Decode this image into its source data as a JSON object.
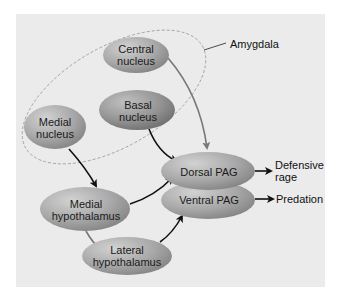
{
  "diagram": {
    "group_label": "Amygdala",
    "nodes": {
      "central_nucleus": {
        "line1": "Central",
        "line2": "nucleus"
      },
      "basal_nucleus": {
        "line1": "Basal",
        "line2": "nucleus"
      },
      "medial_nucleus": {
        "line1": "Medial",
        "line2": "nucleus"
      },
      "medial_hypothalamus": {
        "line1": "Medial",
        "line2": "hypothalamus"
      },
      "lateral_hypothalamus": {
        "line1": "Lateral",
        "line2": "hypothalamus"
      },
      "dorsal_pag": {
        "label": "Dorsal PAG"
      },
      "ventral_pag": {
        "label": "Ventral PAG"
      }
    },
    "outputs": {
      "defensive_rage": {
        "line1": "Defensive",
        "line2": "rage"
      },
      "predation": {
        "label": "Predation"
      }
    },
    "edges": [
      {
        "from": "Central nucleus",
        "to": "Dorsal PAG",
        "color": "#777777"
      },
      {
        "from": "Basal nucleus",
        "to": "Dorsal PAG",
        "color": "#111111"
      },
      {
        "from": "Medial nucleus",
        "to": "Medial hypothalamus",
        "color": "#111111"
      },
      {
        "from": "Medial hypothalamus",
        "to": "Dorsal PAG",
        "color": "#111111"
      },
      {
        "from": "Medial hypothalamus",
        "to": "Lateral hypothalamus",
        "color": "#777777"
      },
      {
        "from": "Lateral hypothalamus",
        "to": "Ventral PAG",
        "color": "#111111"
      },
      {
        "from": "Dorsal PAG",
        "to": "Defensive rage",
        "color": "#111111"
      },
      {
        "from": "Ventral PAG",
        "to": "Predation",
        "color": "#111111"
      }
    ],
    "colors": {
      "panel": "#ebebeb",
      "node_light": "#c4c4c4",
      "node_dark": "#8a8a8a"
    }
  }
}
